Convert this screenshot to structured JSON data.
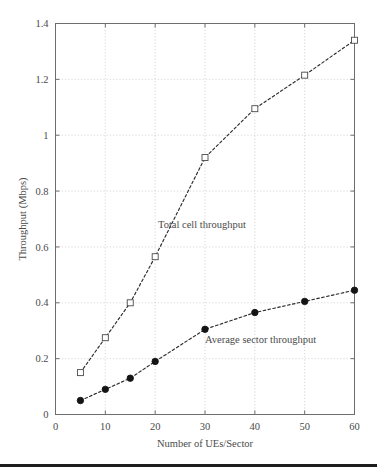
{
  "figure": {
    "background_color": "#ffffff",
    "bottom_rule_color": "#1c1c1c",
    "grid_color": "#bdbdbd",
    "frame_color": "#6d6d6d",
    "line_color": "#2b2b2b"
  },
  "chart_data": {
    "type": "line",
    "title": "",
    "xlabel": "Number of UEs/Sector",
    "ylabel": "Throughput (Mbps)",
    "xlim": [
      0,
      60
    ],
    "ylim": [
      0,
      1.4
    ],
    "xticks": [
      0,
      10,
      20,
      30,
      40,
      50,
      60
    ],
    "xtick_labels": [
      "0",
      "10",
      "20",
      "30",
      "40",
      "50",
      "60"
    ],
    "yticks": [
      0,
      0.2,
      0.4,
      0.6,
      0.8,
      1,
      1.2,
      1.4
    ],
    "ytick_labels": [
      "0",
      "0.2",
      "0.4",
      "0.6",
      "0.8",
      "1",
      "1.2",
      "1.4"
    ],
    "grid": true,
    "legend_position": "inline-annotations",
    "series": [
      {
        "name": "Total cell throughput",
        "marker": "open-square",
        "linestyle": "dashed",
        "x": [
          5,
          10,
          15,
          20,
          30,
          40,
          50,
          60
        ],
        "values": [
          0.15,
          0.275,
          0.4,
          0.565,
          0.92,
          1.095,
          1.215,
          1.34
        ]
      },
      {
        "name": "Average sector throughput",
        "marker": "filled-circle",
        "linestyle": "dashed",
        "x": [
          5,
          10,
          15,
          20,
          30,
          40,
          50,
          60
        ],
        "values": [
          0.05,
          0.09,
          0.13,
          0.19,
          0.305,
          0.365,
          0.405,
          0.445
        ]
      }
    ],
    "annotations": [
      {
        "text": "Total cell throughput",
        "x_px": 158,
        "y_px": 228
      },
      {
        "text": "Average sector throughput",
        "x_px": 205,
        "y_px": 343
      }
    ]
  }
}
